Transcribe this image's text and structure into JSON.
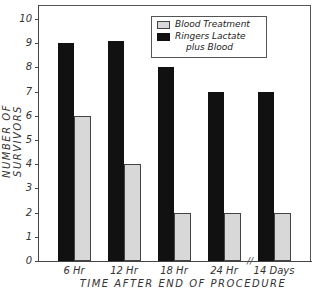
{
  "chart_data": {
    "type": "bar",
    "title": "",
    "xlabel": "TIME AFTER END OF PROCEDURE",
    "ylabel": "NUMBER OF SURVIVORS",
    "categories": [
      "6 Hr",
      "12 Hr",
      "18 Hr",
      "24 Hr",
      "14 Days"
    ],
    "series": [
      {
        "name": "Ringers Lactate plus Blood",
        "color": "#111111",
        "values": [
          9,
          9.1,
          8,
          7,
          7
        ]
      },
      {
        "name": "Blood Treatment",
        "color": "#d8d8d8",
        "pattern": "stippled",
        "values": [
          6,
          4,
          2,
          2,
          2
        ]
      }
    ],
    "ylim": [
      0,
      10.5
    ],
    "yticks": [
      0,
      1,
      2,
      3,
      4,
      5,
      6,
      7,
      8,
      9,
      10
    ],
    "grid": false,
    "legend_position": "upper right",
    "axis_break_between": [
      "24 Hr",
      "14 Days"
    ]
  },
  "legend": {
    "item1": "Blood Treatment",
    "item2_line1": "Ringers Lactate",
    "item2_line2": "plus Blood"
  },
  "axis": {
    "xtitle": "TIME AFTER END OF PROCEDURE",
    "ytitle": "NUMBER OF SURVIVORS",
    "break_mark": "//"
  }
}
